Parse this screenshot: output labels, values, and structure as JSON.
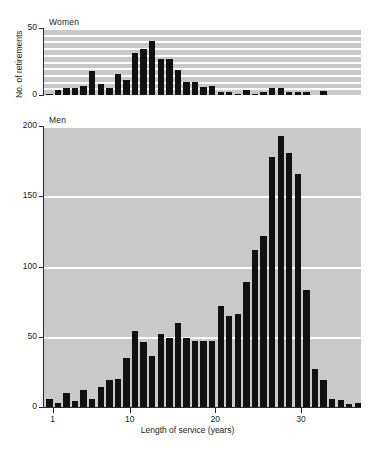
{
  "chart_data": {
    "type": "bar",
    "title": "",
    "xlabel": "Length of service (years)",
    "ylabel": "No. of retirements",
    "grid": true,
    "legend_position": "none",
    "panels": [
      {
        "name": "women",
        "label": "Women",
        "ylim": [
          0,
          50
        ],
        "yticks": [
          0,
          50
        ],
        "ytick_labels": [
          "0",
          "50"
        ],
        "gridlines": [
          5,
          10,
          15,
          20,
          25,
          30,
          35,
          40,
          45,
          50
        ],
        "xlim": [
          0.5,
          37.5
        ],
        "x": [
          1,
          2,
          3,
          4,
          5,
          6,
          7,
          8,
          9,
          10,
          11,
          12,
          13,
          14,
          15,
          16,
          17,
          18,
          19,
          20,
          21,
          22,
          23,
          24,
          25,
          26,
          27,
          28,
          29,
          30,
          31,
          32,
          33,
          34,
          35,
          36,
          37
        ],
        "values": [
          1,
          4,
          5,
          5,
          7,
          18,
          8,
          5,
          16,
          11,
          31,
          34,
          40,
          27,
          27,
          19,
          10,
          10,
          6,
          7,
          2,
          2,
          1,
          4,
          1,
          2,
          5,
          5,
          2,
          2,
          2,
          0,
          3,
          0,
          0,
          0,
          0
        ]
      },
      {
        "name": "men",
        "label": "Men",
        "ylim": [
          0,
          200
        ],
        "yticks": [
          0,
          50,
          100,
          150,
          200
        ],
        "ytick_labels": [
          "0",
          "50",
          "100",
          "150",
          "200"
        ],
        "gridlines": [
          50,
          100,
          150,
          200
        ],
        "xlim": [
          0.5,
          37.5
        ],
        "x": [
          1,
          2,
          3,
          4,
          5,
          6,
          7,
          8,
          9,
          10,
          11,
          12,
          13,
          14,
          15,
          16,
          17,
          18,
          19,
          20,
          21,
          22,
          23,
          24,
          25,
          26,
          27,
          28,
          29,
          30,
          31,
          32,
          33,
          34,
          35,
          36,
          37
        ],
        "values": [
          6,
          3,
          10,
          4,
          12,
          6,
          14,
          19,
          20,
          35,
          54,
          46,
          36,
          52,
          49,
          60,
          49,
          47,
          47,
          47,
          72,
          65,
          66,
          89,
          112,
          122,
          178,
          193,
          181,
          166,
          83,
          27,
          19,
          6,
          5,
          2,
          3
        ]
      }
    ],
    "xticks": [
      1,
      10,
      20,
      30
    ],
    "xtick_labels": [
      "1",
      "10",
      "20",
      "30"
    ]
  },
  "colors": {
    "plot_background": "#c9c9c9",
    "bar": "#111111",
    "gridline": "#ffffff",
    "axis": "#2b2b2b",
    "text": "#222222",
    "page_background": "#ffffff"
  }
}
